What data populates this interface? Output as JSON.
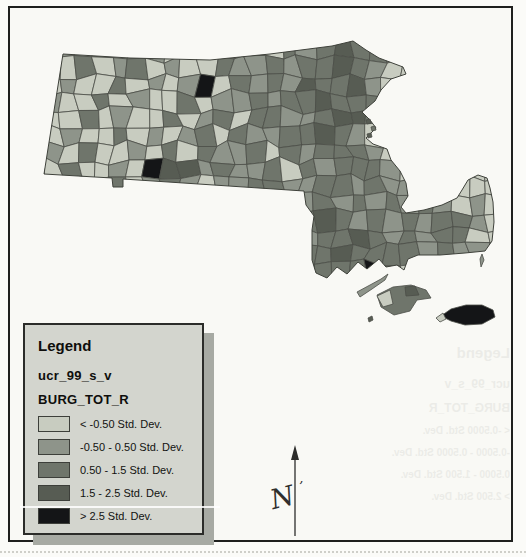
{
  "page": {
    "background": "#fbfbf8"
  },
  "frame": {
    "border_color": "#1f201e"
  },
  "legend": {
    "title": "Legend",
    "layer_name": "ucr_99_s_v",
    "field_name": "BURG_TOT_R",
    "box_fill": "#d3d5ce",
    "shadow_color": "#a7aaa3",
    "items": [
      {
        "label": "< -0.50 Std. Dev.",
        "color": "#c8ccc0"
      },
      {
        "label": "-0.50 - 0.50 Std. Dev.",
        "color": "#8e948a"
      },
      {
        "label": "0.50 - 1.5 Std. Dev.",
        "color": "#6f756b"
      },
      {
        "label": "1.5 - 2.5 Std. Dev.",
        "color": "#575c53"
      },
      {
        "label": "> 2.5 Std. Dev.",
        "color": "#141517"
      }
    ]
  },
  "map": {
    "region": "Massachusetts towns choropleth",
    "class_colors": [
      "#c8ccc0",
      "#8e948a",
      "#6f756b",
      "#575c53",
      "#141517"
    ],
    "cell_stroke": "#4b4e47",
    "outline_stroke": "#3f423b",
    "north_label": "N",
    "grid": {
      "cols": 30,
      "rows": 17,
      "cell": 17,
      "jitter": 9
    },
    "cells": [
      "000000000000000000000000000000",
      "000000000000000001242100000000",
      "000102001021012021232210000000",
      "001020120100211212232100000000",
      "000100201014021213223100000000",
      "001002010020112122322200000000",
      "010020100201202211233200000000",
      "000100201012021122321000000000",
      "001020010202112021222100000000",
      "000200104331211202122210000000",
      "000100201210112211221211000000",
      "000000000000000021212121210100",
      "000000000000000012321212122100",
      "000000000000000021223212122000",
      "000000000000000012232222121100",
      "000000000000000021222420000000",
      "000000000000000000210000000000"
    ],
    "mainland_path": "M 53,46 L 120,50 L 200,52 L 260,46 L 322,38 L 343,33 L 356,42 L 369,50 L 393,59 L 396,66 L 381,71 L 371,82 L 365,93 L 352,104 L 360,112 L 366,120 L 356,130 L 363,136 L 377,141 L 381,152 L 390,163 L 396,175 L 398,188 L 391,199 L 396,205 L 414,202 L 432,197 L 447,190 L 452,182 L 458,172 L 468,167 L 477,170 L 480,180 L 483,194 L 484,214 L 482,233 L 475,243 L 455,245 L 430,247 L 408,247 L 398,251 L 394,262 L 387,257 L 376,259 L 369,251 L 357,261 L 348,254 L 337,266 L 327,259 L 317,270 L 306,265 L 302,252 L 302,222 L 304,208 L 296,197 L 294,183 L 113,171 L 113,179 L 103,179 L 102,170 L 34,166 Z",
    "islands": [
      {
        "name": "elizabeth-islands",
        "path": "M 347,284 L 360,277 L 371,271 L 378,266 L 375,272 L 362,281 L 350,289 Z",
        "cls": 1
      },
      {
        "name": "marthas-vineyard",
        "path": "M 367,287 L 383,279 L 401,277 L 416,282 L 421,290 L 407,292 L 400,303 L 384,307 L 371,299 Z",
        "cls": 2
      },
      {
        "name": "mv-west-light",
        "path": "M 367,288 L 380,282 L 383,296 L 373,299 Z",
        "cls": 0
      },
      {
        "name": "mv-north-dark",
        "path": "M 395,279 L 405,278 L 409,287 L 396,288 Z",
        "cls": 3
      },
      {
        "name": "nantucket",
        "path": "M 431,308 L 441,301 L 456,297 L 472,297 L 483,302 L 485,309 L 472,316 L 455,317 L 441,313 Z",
        "cls": 4
      },
      {
        "name": "nantucket-west-spot",
        "path": "M 426,310 L 433,305 L 436,311 L 430,314 Z",
        "cls": 0
      },
      {
        "name": "harbor-island-1",
        "path": "M 356,112 L 360,111 L 361,115 L 357,116 Z",
        "cls": 3
      },
      {
        "name": "harbor-island-2",
        "path": "M 361,119 L 365,118 L 366,122 L 362,123 Z",
        "cls": 2
      },
      {
        "name": "harbor-island-3",
        "path": "M 357,126 L 361,125 L 362,129 L 358,130 Z",
        "cls": 3
      },
      {
        "name": "monomoy-spit",
        "path": "M 472,246 L 474,252 L 471,259 L 470,251 Z",
        "cls": 1
      },
      {
        "name": "small-island-south",
        "path": "M 358,310 L 362,308 L 363,312 L 359,314 Z",
        "cls": 3
      }
    ]
  },
  "north_arrow": {
    "x": 285,
    "y_top": 437,
    "y_bottom": 528
  },
  "showthrough": {
    "title": "Legend",
    "lines": [
      "ucr_99_s_v",
      "BURG_TOT_R"
    ],
    "items": [
      "< -0.5000 Std. Dev.",
      "-0.5000 - 0.5000 Std. Dev.",
      "0.5000 - 1.500 Std. Dev.",
      "> 2.500 Std. Dev."
    ]
  }
}
